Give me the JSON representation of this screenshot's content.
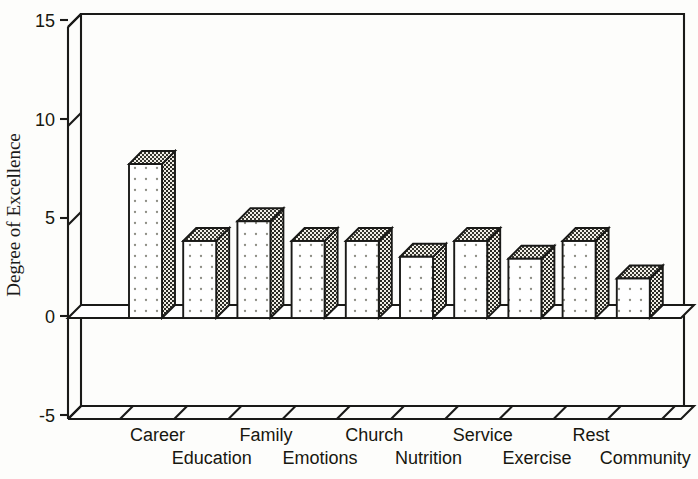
{
  "chart_data": {
    "type": "bar",
    "title": "",
    "xlabel": "",
    "ylabel": "Degree of Excellence",
    "categories": [
      "Career",
      "Education",
      "Family",
      "Emotions",
      "Church",
      "Nutrition",
      "Service",
      "Exercise",
      "Rest",
      "Community"
    ],
    "values": [
      7.7,
      3.8,
      4.8,
      3.8,
      3.8,
      3.0,
      3.8,
      2.9,
      3.8,
      1.9
    ],
    "ylim": [
      -5,
      15
    ],
    "yticks": [
      -5,
      0,
      5,
      10,
      15
    ],
    "ytick_labels": [
      "-5",
      "0",
      "5",
      "10",
      "15"
    ],
    "grid": false,
    "legend": null,
    "style": "3d-bar",
    "series": [
      {
        "name": "Degree of Excellence",
        "values": [
          7.7,
          3.8,
          4.8,
          3.8,
          3.8,
          3.0,
          3.8,
          2.9,
          3.8,
          1.9
        ]
      }
    ],
    "colors": {
      "line": "#1a1a18",
      "bar_front": "#ffffff",
      "bar_dot": "#8d8d84",
      "bar_side": "#f2f0ea",
      "bar_stipple": "#2a2a24",
      "background": "#fdfdfb"
    }
  },
  "axis": {
    "y_label": "Degree of Excellence",
    "ticks": [
      {
        "label": "15",
        "value": 15
      },
      {
        "label": "10",
        "value": 10
      },
      {
        "label": "5",
        "value": 5
      },
      {
        "label": "0",
        "value": 0
      },
      {
        "label": "-5",
        "value": -5
      }
    ]
  },
  "categories_top_row": [
    "Career",
    "Family",
    "Church",
    "Service",
    "Rest"
  ],
  "categories_bottom_row": [
    "Education",
    "Emotions",
    "Nutrition",
    "Exercise",
    "Community"
  ]
}
